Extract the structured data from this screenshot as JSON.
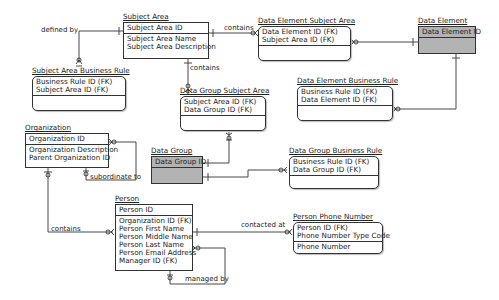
{
  "diagram": {
    "type": "entity-relationship",
    "entities": {
      "subject_area": {
        "name": "Subject Area",
        "pk": [
          "Subject Area ID"
        ],
        "attrs": [
          "Subject Area Name",
          "Subject Area Description"
        ]
      },
      "data_element_subject_area": {
        "name": "Data Element Subject Area",
        "pk": [
          "Data Element ID (FK)",
          "Subject Area ID (FK)"
        ],
        "attrs": []
      },
      "data_element": {
        "name": "Data Element",
        "pk": [
          "Data Element ID"
        ],
        "attrs": []
      },
      "subject_area_business_rule": {
        "name": "Subject Area Business Rule",
        "pk": [
          "Business Rule ID (FK)",
          "Subject Area ID (FK)"
        ],
        "attrs": []
      },
      "data_group_subject_area": {
        "name": "Data Group Subject Area",
        "pk": [
          "Subject Area ID (FK)",
          "Data Group ID (FK)"
        ],
        "attrs": []
      },
      "data_element_business_rule": {
        "name": "Data Element Business Rule",
        "pk": [
          "Business Rule ID (FK)",
          "Data Element ID (FK)"
        ],
        "attrs": []
      },
      "organization": {
        "name": "Organization",
        "pk": [
          "Organization ID"
        ],
        "attrs": [
          "Organization Description",
          "Parent Organization ID"
        ]
      },
      "data_group": {
        "name": "Data Group",
        "pk": [
          "Data Group ID"
        ],
        "attrs": []
      },
      "data_group_business_rule": {
        "name": "Data Group Business Rule",
        "pk": [
          "Business Rule ID (FK)",
          "Data Group ID (FK)"
        ],
        "attrs": []
      },
      "person": {
        "name": "Person",
        "pk": [
          "Person ID"
        ],
        "attrs": [
          "Organization ID (FK)",
          "Person First Name",
          "Person Middle Name",
          "Person Last Name",
          "Person Email Address",
          "Manager ID (FK)"
        ]
      },
      "person_phone_number": {
        "name": "Person Phone Number",
        "pk": [
          "Person ID (FK)",
          "Phone Number Type Code"
        ],
        "attrs": [
          "Phone Number"
        ]
      }
    },
    "relationships": {
      "defined_by": "defined by",
      "contains_sa_desa": "contains",
      "contains_sa_dgsa": "contains",
      "subordinate_to": "subordinate to",
      "contains_org_person": "contains",
      "contacted_at": "contacted at",
      "managed_by": "managed by"
    },
    "colors": {
      "line": "#333333",
      "gray_entity": "#b3b3b3"
    }
  }
}
